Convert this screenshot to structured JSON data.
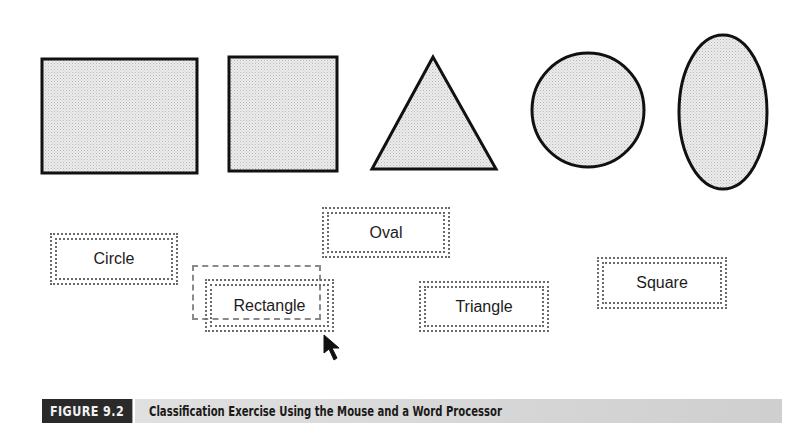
{
  "shapes": [
    {
      "name": "rectangle",
      "type": "rect",
      "x": 42,
      "y": 59,
      "w": 155,
      "h": 114
    },
    {
      "name": "square",
      "type": "rect",
      "x": 229,
      "y": 57,
      "w": 108,
      "h": 114
    },
    {
      "name": "triangle",
      "type": "polygon",
      "points": "433,57 372,169 496,169"
    },
    {
      "name": "circle",
      "type": "ellipse",
      "cx": 588,
      "cy": 110,
      "rx": 56,
      "ry": 57
    },
    {
      "name": "oval",
      "type": "ellipse",
      "cx": 723,
      "cy": 112,
      "rx": 44,
      "ry": 77
    }
  ],
  "shape_style": {
    "fill": "#e4e4e4",
    "stroke": "#111111"
  },
  "labels": {
    "circle": "Circle",
    "rectangle": "Rectangle",
    "oval": "Oval",
    "triangle": "Triangle",
    "square": "Square"
  },
  "caption": {
    "figure_number": "FIGURE 9.2",
    "title": "Classification Exercise Using the Mouse and a Word Processor"
  }
}
